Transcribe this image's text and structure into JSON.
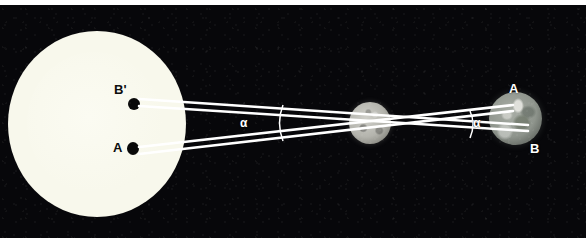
{
  "figure": {
    "background_color": "#07070a",
    "line_color": "#ffffff",
    "border_color": "#ffffff"
  },
  "bodies": {
    "sun": {
      "name": "Sun",
      "center_x": 94,
      "center_y": 117,
      "radius": 68,
      "color": "#f8f8ec"
    },
    "moon": {
      "name": "Transiting body",
      "center_x": 370,
      "center_y": 118,
      "radius": 21,
      "color": "#b4b4ad"
    },
    "earth": {
      "name": "Earth",
      "center_x": 515,
      "center_y": 113,
      "radius": 26,
      "color": "#8e948c"
    }
  },
  "labels": {
    "transit_b_prime": "B'",
    "transit_a": "A",
    "earth_a": "A",
    "earth_b": "B",
    "angle_left": "α",
    "angle_right": "α"
  },
  "sight_lines": [
    {
      "id": "line-a",
      "from_label": "A",
      "from_point": "sun-disc-dot-A",
      "to_label": "A",
      "to_point": "earth-observer-A",
      "x1": 139,
      "y1": 144,
      "x2": 513,
      "y2": 101
    },
    {
      "id": "line-b-prime",
      "from_label": "B'",
      "from_point": "sun-disc-dot-B-prime",
      "to_label": "B",
      "to_point": "earth-observer-B",
      "x1": 139,
      "y1": 99,
      "x2": 528,
      "y2": 125
    },
    {
      "id": "line-a-upper-edge",
      "from_label": "A",
      "to_label": "B",
      "x1": 139,
      "y1": 96,
      "x2": 528,
      "y2": 122
    },
    {
      "id": "line-b-lower-edge",
      "from_label": "B'",
      "to_label": "A",
      "x1": 139,
      "y1": 148,
      "x2": 513,
      "y2": 104
    }
  ],
  "angle_markers": [
    {
      "id": "angle-left",
      "vertex_x": 370,
      "vertex_y": 118,
      "arc_x": 282,
      "arc_y1": 101,
      "arc_y2": 135
    },
    {
      "id": "angle-right",
      "vertex_x": 370,
      "vertex_y": 118,
      "arc_x": 470,
      "arc_y1": 107,
      "arc_y2": 132
    }
  ]
}
